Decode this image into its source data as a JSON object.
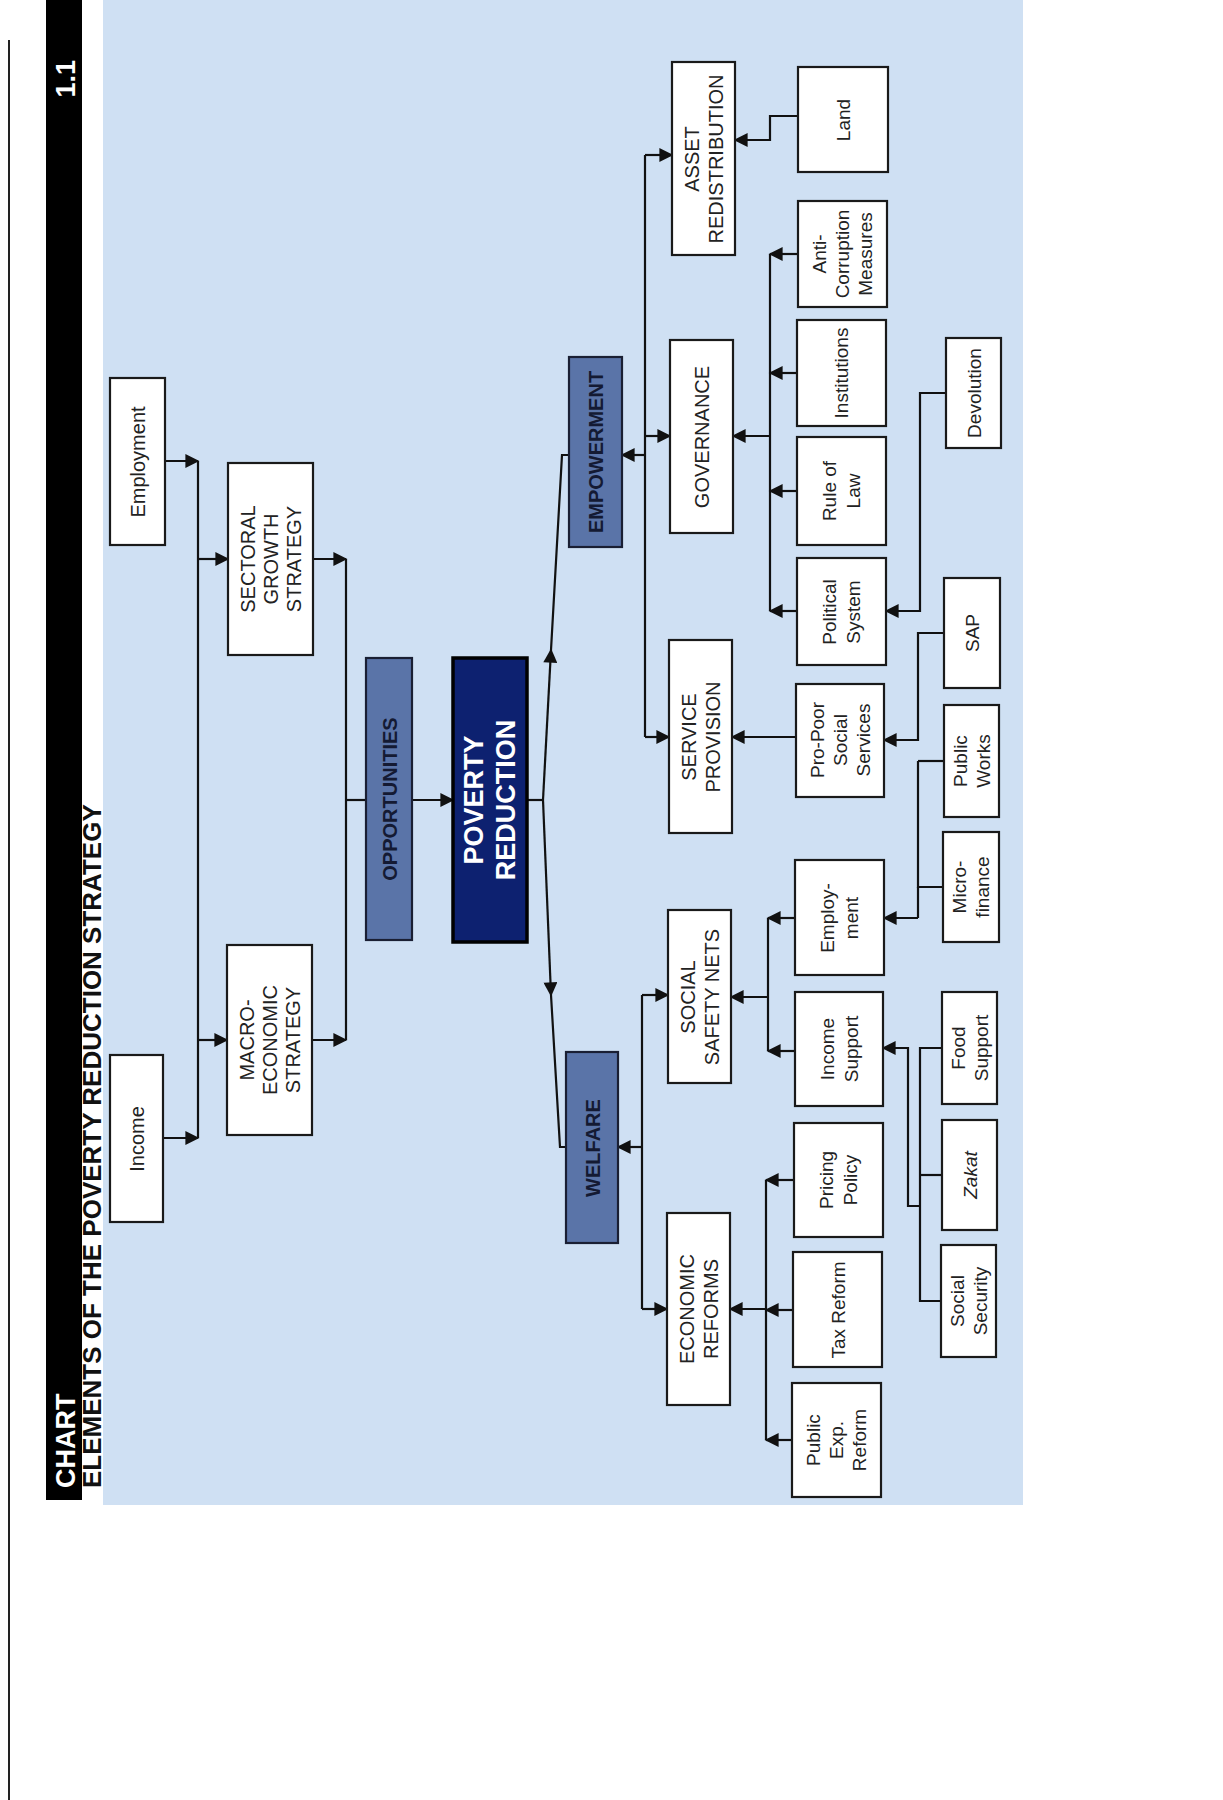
{
  "header": {
    "label": "CHART",
    "number": "1.1",
    "title": "ELEMENTS OF THE POVERTY REDUCTION STRATEGY"
  },
  "colors": {
    "background_panel": "#cfe0f3",
    "pillar_fill": "#5a74a8",
    "core_fill": "#0d2170",
    "box_fill": "#ffffff",
    "header_bar": "#000000"
  },
  "nodes": {
    "poverty_reduction": [
      "POVERTY",
      "REDUCTION"
    ],
    "opportunities": "OPPORTUNITIES",
    "empowerment": "EMPOWERMENT",
    "welfare": "WELFARE",
    "sectoral_growth": [
      "SECTORAL",
      "GROWTH",
      "STRATEGY"
    ],
    "macroeconomic": [
      "MACRO-",
      "ECONOMIC",
      "STRATEGY"
    ],
    "employment_top": "Employment",
    "income_top": "Income",
    "asset_redistribution": [
      "ASSET",
      "REDISTRIBUTION"
    ],
    "governance": "GOVERNANCE",
    "service_provision": [
      "SERVICE",
      "PROVISION"
    ],
    "social_safety_nets": [
      "SOCIAL",
      "SAFETY NETS"
    ],
    "economic_reforms": [
      "ECONOMIC",
      "REFORMS"
    ],
    "land": "Land",
    "anti_corruption": [
      "Anti-",
      "Corruption",
      "Measures"
    ],
    "institutions": "Institutions",
    "rule_of_law": [
      "Rule of",
      "Law"
    ],
    "political_system": [
      "Political",
      "System"
    ],
    "pro_poor": [
      "Pro-Poor",
      "Social",
      "Services"
    ],
    "employment_ssn": [
      "Employ-",
      "ment"
    ],
    "income_support": [
      "Income",
      "Support"
    ],
    "pricing_policy": [
      "Pricing",
      "Policy"
    ],
    "tax_reform": "Tax Reform",
    "public_exp_reform": [
      "Public",
      "Exp.",
      "Reform"
    ],
    "devolution": "Devolution",
    "sap": "SAP",
    "public_works": [
      "Public",
      "Works"
    ],
    "microfinance": [
      "Micro-",
      "finance"
    ],
    "food_support": [
      "Food",
      "Support"
    ],
    "zakat": "Zakat",
    "social_security": [
      "Social",
      "Security"
    ]
  }
}
